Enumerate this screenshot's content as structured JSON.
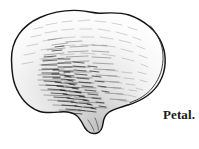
{
  "figure": {
    "kind": "botanical-line-engraving",
    "subject": "Petal",
    "caption": "Petal.",
    "background_color": "#ffffff",
    "ink_color": "#1a1a1a",
    "shading_color": "#4a4a4a",
    "canvas": {
      "width": 199,
      "height": 149
    },
    "outline": {
      "stroke_width": 1.4,
      "double_edge_side": "right",
      "bounds": {
        "left": 11,
        "top": 10,
        "right": 166,
        "bottom": 134
      },
      "claw_notch": {
        "x": 99,
        "y": 120
      }
    },
    "shading": {
      "style": "hatching",
      "densest_region": {
        "x": 60,
        "y": 85
      },
      "direction": "diagonal-and-horizontal",
      "stroke_count": 300
    }
  },
  "caption_block": {
    "text": "Petal.",
    "x": 163,
    "y": 107,
    "font_size_px": 13
  }
}
